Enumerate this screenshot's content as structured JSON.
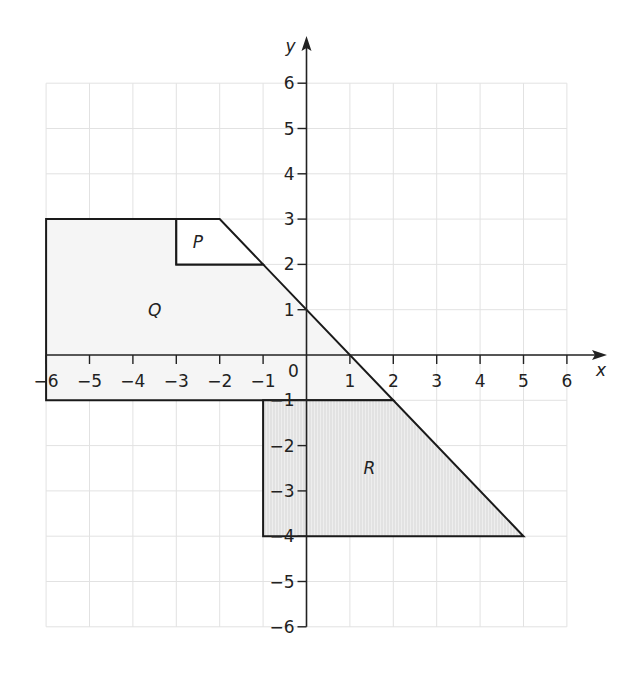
{
  "diagram": {
    "type": "coordinate-plane",
    "axes": {
      "x_label": "x",
      "y_label": "y",
      "origin_label": "0",
      "x_range": [
        -6,
        6
      ],
      "y_range": [
        -6,
        6
      ],
      "x_ticks": [
        "−6",
        "−5",
        "−4",
        "−3",
        "−2",
        "−1",
        "1",
        "2",
        "3",
        "4",
        "5",
        "6"
      ],
      "y_ticks": [
        "6",
        "5",
        "4",
        "3",
        "2",
        "1",
        "−1",
        "−2",
        "−3",
        "−4",
        "−5",
        "−6"
      ]
    },
    "shapes": [
      {
        "label": "P",
        "vertices": [
          [
            -3,
            3
          ],
          [
            -2,
            3
          ],
          [
            -1,
            2
          ],
          [
            -3,
            2
          ]
        ],
        "fill": "#ffffff"
      },
      {
        "label": "Q",
        "vertices": [
          [
            -6,
            3
          ],
          [
            -3,
            3
          ],
          [
            -3,
            2
          ],
          [
            -1,
            2
          ],
          [
            2,
            -1
          ],
          [
            -6,
            -1
          ]
        ],
        "fill": "#f4f4f4"
      },
      {
        "label": "R",
        "vertices": [
          [
            -1,
            -1
          ],
          [
            2,
            -1
          ],
          [
            5,
            -4
          ],
          [
            -1,
            -4
          ]
        ],
        "fill": "#e6e6e6"
      }
    ],
    "colors": {
      "grid": "#e2e2e2",
      "axis": "#222222",
      "outline": "#1a1a1a"
    }
  }
}
